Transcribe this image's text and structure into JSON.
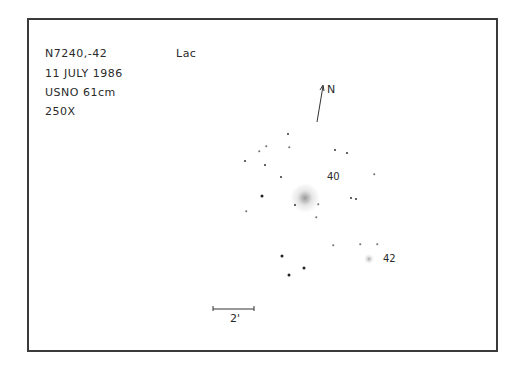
{
  "notes": {
    "object": "N7240,-42",
    "constellation": "Lac",
    "date": "11 JULY 1986",
    "telescope": "USNO 61cm",
    "magnification": "250X"
  },
  "orientation": {
    "label": "N"
  },
  "scale_bar": {
    "label": "2'"
  },
  "galaxies": [
    {
      "id": "N7240",
      "x": 305,
      "y": 198,
      "size": 30,
      "color": "#9a9a9a"
    },
    {
      "id": "42",
      "x": 369,
      "y": 259,
      "size": 10,
      "color": "#aaaaaa"
    }
  ],
  "galaxy_labels": [
    {
      "text": "40",
      "x": 327,
      "y": 172
    },
    {
      "text": "42",
      "x": 383,
      "y": 254
    }
  ],
  "stars": [
    {
      "x": 288,
      "y": 134,
      "m": 2
    },
    {
      "x": 266,
      "y": 146,
      "m": 3
    },
    {
      "x": 289,
      "y": 147,
      "m": 3
    },
    {
      "x": 259,
      "y": 151,
      "m": 3
    },
    {
      "x": 335,
      "y": 150,
      "m": 2
    },
    {
      "x": 347,
      "y": 153,
      "m": 2
    },
    {
      "x": 245,
      "y": 161,
      "m": 2
    },
    {
      "x": 265,
      "y": 165,
      "m": 2
    },
    {
      "x": 281,
      "y": 177,
      "m": 2
    },
    {
      "x": 374,
      "y": 174,
      "m": 3
    },
    {
      "x": 262,
      "y": 196,
      "m": 1
    },
    {
      "x": 295,
      "y": 205,
      "m": 2
    },
    {
      "x": 318,
      "y": 204,
      "m": 3
    },
    {
      "x": 351,
      "y": 198,
      "m": 2
    },
    {
      "x": 356,
      "y": 199,
      "m": 2
    },
    {
      "x": 246,
      "y": 211,
      "m": 3
    },
    {
      "x": 316,
      "y": 217,
      "m": 3
    },
    {
      "x": 333,
      "y": 245,
      "m": 3
    },
    {
      "x": 360,
      "y": 244,
      "m": 3
    },
    {
      "x": 377,
      "y": 244,
      "m": 3
    },
    {
      "x": 282,
      "y": 256,
      "m": 1
    },
    {
      "x": 304,
      "y": 268,
      "m": 1
    },
    {
      "x": 289,
      "y": 275,
      "m": 1
    }
  ]
}
